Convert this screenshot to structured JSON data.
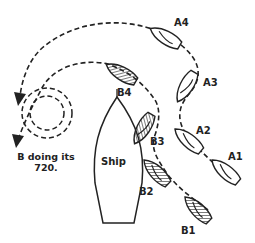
{
  "diagram": {
    "ship_label": "Ship",
    "caption_line1": "B doing its",
    "caption_line2": "720.",
    "boats": {
      "A1": "A1",
      "A2": "A2",
      "A3": "A3",
      "A4": "A4",
      "B1": "B1",
      "B2": "B2",
      "B3": "B3",
      "B4": "B4"
    },
    "colors": {
      "line": "#222222",
      "background": "#ffffff"
    }
  }
}
